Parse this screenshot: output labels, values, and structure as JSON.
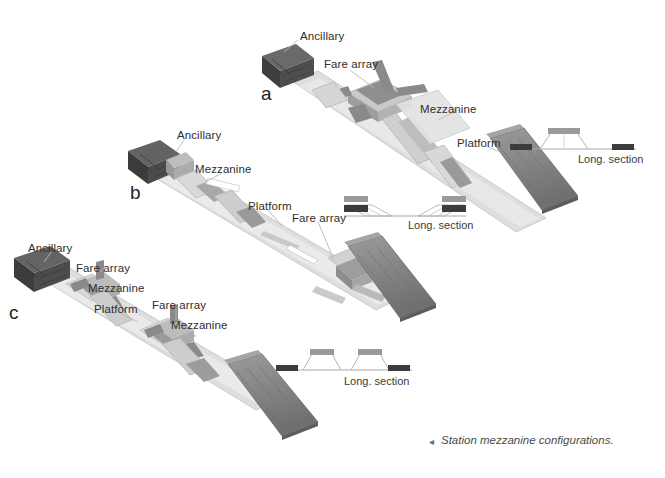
{
  "figure": {
    "caption_marker": "◂",
    "caption": "Station mezzanine configurations."
  },
  "configs": [
    {
      "id": "a",
      "letter": "a",
      "name": "single-center-mezzanine",
      "labels": [
        {
          "text": "Ancillary",
          "x": 300,
          "y": 30
        },
        {
          "text": "Fare array",
          "x": 324,
          "y": 58
        },
        {
          "text": "Mezzanine",
          "x": 420,
          "y": 103
        },
        {
          "text": "Platform",
          "x": 457,
          "y": 137
        }
      ],
      "section": {
        "label": "Long. section",
        "label_x": 578,
        "label_y": 153,
        "type": "center-mezzanine",
        "baseline_x": 508,
        "baseline_y": 149,
        "baseline_w": 128,
        "platform_bars": [
          {
            "x": 510,
            "y": 144,
            "w": 22,
            "h": 7,
            "color": "#3c3c3c"
          },
          {
            "x": 612,
            "y": 144,
            "w": 22,
            "h": 7,
            "color": "#3c3c3c"
          }
        ],
        "mezzanines": [
          {
            "cx": 563,
            "top_y": 133,
            "top_w": 34,
            "bottom_w": 62,
            "bar_color": "#9a9a9a"
          }
        ]
      }
    },
    {
      "id": "b",
      "letter": "b",
      "name": "end-mezzanines",
      "labels": [
        {
          "text": "Ancillary",
          "x": 177,
          "y": 129
        },
        {
          "text": "Mezzanine",
          "x": 195,
          "y": 163
        },
        {
          "text": "Platform",
          "x": 248,
          "y": 200
        },
        {
          "text": "Fare array",
          "x": 292,
          "y": 212
        }
      ],
      "section": {
        "label": "Long. section",
        "label_x": 408,
        "label_y": 219,
        "type": "end-mezzanine",
        "baseline_x": 344,
        "baseline_y": 216,
        "baseline_w": 122,
        "platform_bars": [
          {
            "x": 346,
            "y": 209,
            "w": 24,
            "h": 7,
            "color": "#3c3c3c"
          },
          {
            "x": 442,
            "y": 209,
            "w": 24,
            "h": 7,
            "color": "#3c3c3c"
          }
        ],
        "upper_bars": [
          {
            "x": 346,
            "y": 197,
            "w": 24,
            "h": 7,
            "color": "#9a9a9a"
          },
          {
            "x": 442,
            "y": 197,
            "w": 24,
            "h": 7,
            "color": "#9a9a9a"
          }
        ]
      }
    },
    {
      "id": "c",
      "letter": "c",
      "name": "twin-center-mezzanines",
      "labels": [
        {
          "text": "Ancillary",
          "x": 28,
          "y": 242
        },
        {
          "text": "Fare array",
          "x": 76,
          "y": 262
        },
        {
          "text": "Mezzanine",
          "x": 88,
          "y": 282
        },
        {
          "text": "Platform",
          "x": 94,
          "y": 303
        },
        {
          "text": "Fare array",
          "x": 152,
          "y": 299
        },
        {
          "text": "Mezzanine",
          "x": 171,
          "y": 319
        }
      ],
      "section": {
        "label": "Long. section",
        "label_x": 344,
        "label_y": 375,
        "type": "twin-center-mezzanine",
        "baseline_x": 274,
        "baseline_y": 370,
        "baseline_w": 138,
        "platform_bars": [
          {
            "x": 276,
            "y": 364,
            "w": 22,
            "h": 7,
            "color": "#3c3c3c"
          },
          {
            "x": 388,
            "y": 364,
            "w": 22,
            "h": 7,
            "color": "#3c3c3c"
          }
        ],
        "mezzanines": [
          {
            "cx": 320,
            "top_y": 352,
            "top_w": 26,
            "bottom_w": 50,
            "bar_color": "#9a9a9a"
          },
          {
            "cx": 372,
            "top_y": 352,
            "top_w": 26,
            "bottom_w": 50,
            "bar_color": "#9a9a9a"
          }
        ]
      }
    }
  ],
  "colors": {
    "ancillary_box": "#4a4a4a",
    "tunnel": "#8c8c8c",
    "platform_slab": "#dcdcdc",
    "mezzanine_box": "#b0b0b0",
    "leader_line": "#b4b4b4",
    "section_dark_bar": "#3c3c3c",
    "section_gray_bar": "#9a9a9a",
    "section_line": "#9e9e9e",
    "background": "#ffffff"
  }
}
